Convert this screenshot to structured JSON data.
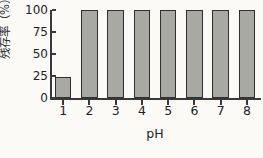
{
  "chart_data": {
    "type": "bar",
    "title": "",
    "categories": [
      "1",
      "2",
      "3",
      "4",
      "5",
      "6",
      "7",
      "8"
    ],
    "values": [
      24,
      100,
      100,
      100,
      100,
      100,
      100,
      100
    ],
    "xlabel": "pH",
    "ylabel": "残存率（%）",
    "ylim": [
      0,
      100
    ],
    "yticks": [
      0,
      25,
      50,
      75,
      100
    ],
    "ytick_labels": [
      "0",
      "25",
      "50",
      "75",
      "100"
    ],
    "grid": false,
    "legend": null,
    "bar_color": "#a9a9a4",
    "bar_edge_color": "#2f2f2f",
    "axis_color": "#3a3a3a",
    "background_color": "#fbfaf6"
  }
}
